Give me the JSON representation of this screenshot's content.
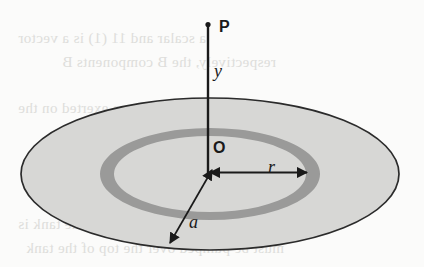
{
  "figure": {
    "background_color": "#fbfbfa",
    "ink_color": "#1a1a1a",
    "disk_fill_color": "#d7d7d5",
    "ring_fill_color": "#9a9a99",
    "labels": {
      "point_p": "P",
      "height_y": "y",
      "origin_o": "O",
      "ring_radius_r": "r",
      "disk_radius_a": "a"
    },
    "geometry": {
      "disk_center_x": 210,
      "disk_center_y": 174,
      "disk_rx": 189,
      "disk_ry": 76,
      "ring_outer_rx": 110,
      "ring_outer_ry": 46,
      "ring_inner_rx": 96,
      "ring_inner_ry": 38,
      "axis_top_y": 24,
      "axis_bottom_y": 173,
      "axis_x": 208
    }
  },
  "ghost_text": {
    "note": "faint mirrored bleed-through text from reverse page",
    "lines": [
      {
        "text": "a scalar and 11 (1) is a vector",
        "x": 18,
        "y": 30,
        "size": 15
      },
      {
        "text": "respectively, the B components B",
        "x": 62,
        "y": 54,
        "size": 15
      },
      {
        "text": "The torque exerted on the",
        "x": 18,
        "y": 100,
        "size": 15
      },
      {
        "text": "The volume of the tank is",
        "x": 18,
        "y": 216,
        "size": 15
      },
      {
        "text": "must be pumped over the top of the tank",
        "x": 26,
        "y": 240,
        "size": 15
      }
    ]
  }
}
